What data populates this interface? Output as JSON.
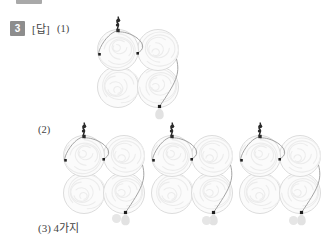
{
  "page": {
    "background_color": "#ffffff",
    "text_color": "#444444",
    "top_cut_bar": {
      "name": "cropped-header-bar",
      "color": "#9a9a9a"
    }
  },
  "question": {
    "number": "3",
    "badge_color": "#8d8d8d",
    "badge_text_color": "#ffffff",
    "answer_label": "[답]",
    "part1_label": "(1)",
    "part2_label": "(2)",
    "part3_label": "(3) 4가지"
  },
  "illustration": {
    "description": "yarn-ball clusters",
    "ball_fill": "#fbfbfb",
    "ball_stroke": "#d8d8d8",
    "swirl_stroke": "#ececec",
    "thread_color": "#9a9a9a",
    "knot_color": "#2b2b2b",
    "bead_color": "#e2e2e2",
    "ball_count_per_cluster": 4,
    "clusters": [
      {
        "name": "cluster-part1",
        "x": 96,
        "y": 26,
        "start_corner": "top-left",
        "path": "left-arc"
      },
      {
        "name": "cluster-part2-a",
        "x": 62,
        "y": 132,
        "start_corner": "top-left",
        "path": "left-arc-to-center"
      },
      {
        "name": "cluster-part2-b",
        "x": 150,
        "y": 132,
        "start_corner": "top-left",
        "path": "left-arc-to-center"
      },
      {
        "name": "cluster-part2-c",
        "x": 238,
        "y": 132,
        "start_corner": "top-left",
        "path": "left-arc-to-center"
      }
    ]
  },
  "decorations": {
    "stray_dots": [
      {
        "name": "stray-dot-left",
        "x": 112,
        "y": 214
      },
      {
        "name": "stray-dot-mid",
        "x": 202,
        "y": 216
      },
      {
        "name": "stray-dot-right",
        "x": 289,
        "y": 216
      }
    ]
  },
  "chart_data": null
}
